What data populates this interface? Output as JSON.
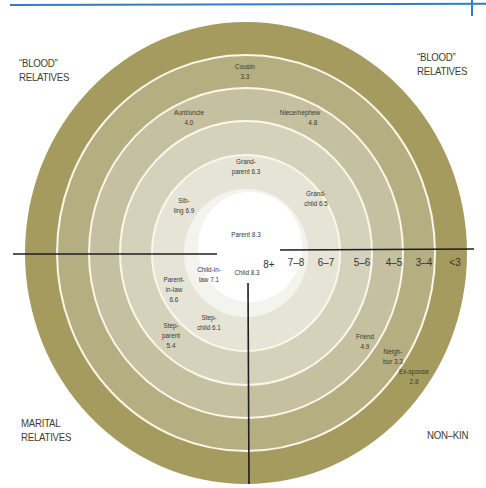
{
  "corner_labels": {
    "top_left": [
      "“BLOOD”",
      "RELATIVES"
    ],
    "top_right": [
      "“BLOOD”",
      "RELATIVES"
    ],
    "bottom_left": [
      "MARITAL",
      "RELATIVES"
    ],
    "bottom_right": [
      "NON–KIN"
    ]
  },
  "scale_labels": [
    "8+",
    "7–8",
    "6–7",
    "5–6",
    "4–5",
    "3–4",
    "<3"
  ],
  "ring_colors": [
    "#a59b5e",
    "#b5ae80",
    "#c5c09f",
    "#d5d2bc",
    "#e5e4d7",
    "#f2f2ec",
    "#ffffff"
  ],
  "relationships": {
    "cousin": {
      "name": "Cousin",
      "score": "3.3"
    },
    "aunt_uncle": {
      "name": "Aunt/uncle",
      "score": "4.0"
    },
    "niece_nephew": {
      "name": "Niece/nephew",
      "score": "4.8"
    },
    "grandparent": {
      "name1": "Grand-",
      "name2": "parent 6.3"
    },
    "grandchild": {
      "name1": "Grand-",
      "name2": "child 6.5"
    },
    "sibling": {
      "name1": "Sib-",
      "name2": "ling 6.9"
    },
    "parent": {
      "name": "Parent 8.3"
    },
    "child": {
      "name": "Child 8.3"
    },
    "child_in_law": {
      "name1": "Child-in-",
      "name2": "law 7.1"
    },
    "parent_in_law": {
      "name1": "Parent-",
      "name2": "in-law",
      "score": "6.6"
    },
    "stepchild": {
      "name1": "Step-",
      "name2": "child 6.1"
    },
    "stepparent": {
      "name1": "Step-",
      "name2": "parent",
      "score": "5.4"
    },
    "friend": {
      "name": "Friend",
      "score": "4.9"
    },
    "neighbor": {
      "name1": "Neigh-",
      "name2": "bor 3.3"
    },
    "ex_spouse": {
      "name": "Ex-spouse",
      "score": "2.8"
    }
  }
}
